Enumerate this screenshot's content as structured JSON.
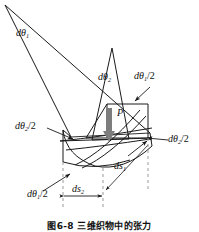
{
  "figure": {
    "caption": "图6-8  三维织物中的张力",
    "point_label": "P",
    "labels": {
      "dtheta1": "dθ",
      "dtheta1_sub": "1",
      "dtheta2": "dθ",
      "dtheta2_sub": "2",
      "dtheta1_half_top": "dθ",
      "dtheta1_half_top_sub": "1",
      "dtheta1_half_top_tail": "/2",
      "dtheta2_half_left": "dθ",
      "dtheta2_half_left_sub": "2",
      "dtheta2_half_left_tail": "/2",
      "dtheta2_half_right": "dθ",
      "dtheta2_half_right_sub": "2",
      "dtheta2_half_right_tail": "/2",
      "dtheta1_half_bottom": "dθ",
      "dtheta1_half_bottom_sub": "1",
      "dtheta1_half_bottom_tail": "/2",
      "ds1": "ds",
      "ds1_sub": "1",
      "ds2": "ds",
      "ds2_sub": "2"
    },
    "colors": {
      "line": "#1a1a1a",
      "dashed_guide": "#9a9a9a",
      "load_arrow": "#7d7d7d",
      "background": "#ffffff",
      "text": "#111111"
    }
  }
}
